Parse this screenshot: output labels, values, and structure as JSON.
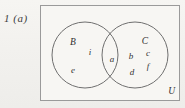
{
  "figure": {
    "question_label": "1  (a)",
    "universe_label": "U",
    "sets": [
      {
        "name": "set-B",
        "label": "B",
        "cx": 85,
        "cy": 55,
        "r": 33
      },
      {
        "name": "set-C",
        "label": "C",
        "cx": 135,
        "cy": 55,
        "r": 33
      }
    ],
    "set_label_positions": [
      {
        "label": "B",
        "x": 73,
        "y": 42
      },
      {
        "label": "C",
        "x": 145,
        "y": 41
      }
    ],
    "elements": [
      {
        "label": "i",
        "region": "B-only",
        "x": 90,
        "y": 52
      },
      {
        "label": "e",
        "region": "B-only",
        "x": 73,
        "y": 70
      },
      {
        "label": "a",
        "region": "B-and-C",
        "x": 112,
        "y": 59
      },
      {
        "label": "b",
        "region": "C-only",
        "x": 131,
        "y": 56
      },
      {
        "label": "c",
        "region": "C-only",
        "x": 148,
        "y": 53
      },
      {
        "label": "d",
        "region": "C-only",
        "x": 132,
        "y": 72
      },
      {
        "label": "f",
        "region": "C-only",
        "x": 148,
        "y": 66
      }
    ],
    "colors": {
      "paper": "#f4f3f0",
      "ink": "#333333",
      "stroke": "#6f6f6f",
      "rect_stroke": "#9a9a9a"
    }
  }
}
